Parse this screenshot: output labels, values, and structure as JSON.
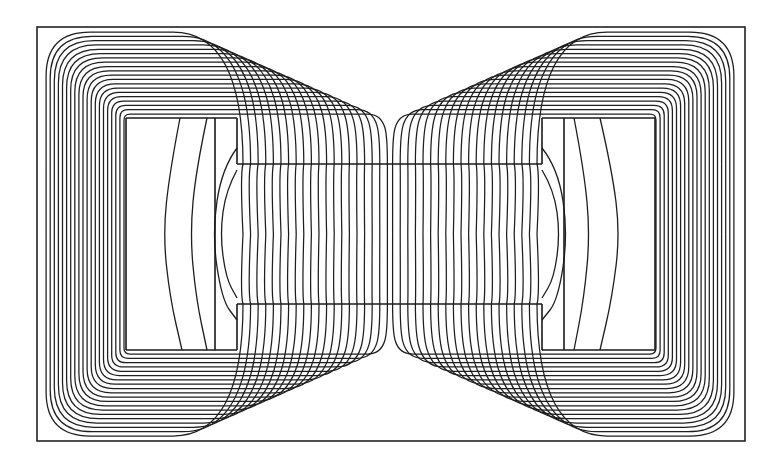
{
  "diagram": {
    "title": "Magnetic flux line plot of shell-type core",
    "colors": {
      "line": "#1e1e1e",
      "background": "#ffffff"
    },
    "frame": {
      "x1": 37,
      "y1": 27,
      "x2": 745,
      "y2": 441
    },
    "center": {
      "x": 390,
      "y": 234
    },
    "core": {
      "x1": 237,
      "y1": 164,
      "x2": 542,
      "y2": 304
    },
    "windows": [
      {
        "side": "left",
        "x1": 126,
        "y1": 118,
        "x2": 237,
        "y2": 350,
        "divider_x": 215
      },
      {
        "side": "right",
        "x1": 542,
        "y1": 118,
        "x2": 655,
        "y2": 350,
        "divider_x": 564
      }
    ],
    "flux_loops": {
      "count_per_side": 20,
      "core_spacing": 7.6,
      "yoke_spacing": 4.1,
      "top_inner_y": 118,
      "top_outer_y": 36,
      "outer_x_left": 45,
      "inner_x_left": 126
    },
    "window_arcs_left": [
      [
        [
          180,
          118
        ],
        [
          170,
          170
        ],
        [
          163,
          234
        ],
        [
          170,
          298
        ],
        [
          182,
          350
        ]
      ],
      [
        [
          207,
          118
        ],
        [
          196,
          170
        ],
        [
          190,
          234
        ],
        [
          196,
          298
        ],
        [
          207,
          350
        ]
      ],
      [
        [
          237,
          148
        ],
        [
          222,
          168
        ],
        [
          212,
          234
        ],
        [
          222,
          300
        ],
        [
          237,
          320
        ]
      ],
      [
        [
          237,
          170
        ],
        [
          226,
          190
        ],
        [
          220,
          234
        ],
        [
          226,
          278
        ],
        [
          237,
          298
        ]
      ]
    ],
    "window_arcs_right": [
      [
        [
          600,
          118
        ],
        [
          612,
          170
        ],
        [
          620,
          234
        ],
        [
          612,
          298
        ],
        [
          600,
          350
        ]
      ],
      [
        [
          574,
          118
        ],
        [
          584,
          170
        ],
        [
          590,
          234
        ],
        [
          584,
          298
        ],
        [
          574,
          350
        ]
      ],
      [
        [
          542,
          148
        ],
        [
          558,
          168
        ],
        [
          568,
          234
        ],
        [
          558,
          300
        ],
        [
          542,
          320
        ]
      ],
      [
        [
          542,
          170
        ],
        [
          554,
          190
        ],
        [
          560,
          234
        ],
        [
          554,
          278
        ],
        [
          542,
          298
        ]
      ]
    ]
  }
}
